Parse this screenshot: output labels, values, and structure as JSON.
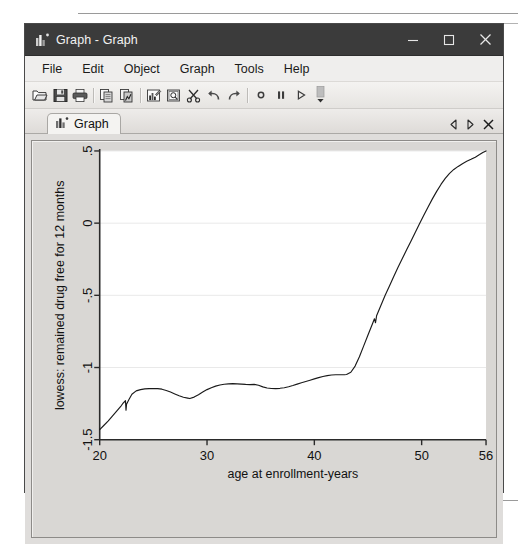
{
  "window": {
    "title": "Graph - Graph",
    "app_icon": "bar-chart-icon",
    "controls": {
      "minimize": "minimize-icon",
      "maximize": "maximize-icon",
      "close": "close-icon"
    }
  },
  "menu": {
    "items": [
      {
        "label": "File"
      },
      {
        "label": "Edit"
      },
      {
        "label": "Object"
      },
      {
        "label": "Graph"
      },
      {
        "label": "Tools"
      },
      {
        "label": "Help"
      }
    ]
  },
  "toolbar": {
    "buttons": [
      {
        "name": "open-icon"
      },
      {
        "name": "save-icon"
      },
      {
        "name": "print-icon"
      },
      {
        "name": "copy-icon"
      },
      {
        "name": "paste-graph-icon"
      },
      {
        "name": "graph-editor-icon"
      },
      {
        "name": "preview-icon"
      },
      {
        "name": "cut-icon"
      },
      {
        "name": "undo-icon"
      },
      {
        "name": "redo-icon"
      },
      {
        "name": "record-icon"
      },
      {
        "name": "pause-icon"
      },
      {
        "name": "play-icon"
      },
      {
        "name": "toolbar-overflow-icon"
      }
    ]
  },
  "tabs": {
    "items": [
      {
        "label": "Graph",
        "icon": "bar-chart-icon",
        "active": true
      }
    ],
    "nav": {
      "prev": "chevron-left-icon",
      "next": "chevron-right-icon",
      "close": "close-tab-icon"
    }
  },
  "chart_data": {
    "type": "line",
    "title": "",
    "subtitle": "",
    "xlabel": "age at enrollment-years",
    "ylabel": "lowess: remained drug free for 12 months",
    "xlim": [
      20,
      56
    ],
    "ylim": [
      -1.5,
      0.5
    ],
    "xticks": [
      20,
      30,
      40,
      50,
      56
    ],
    "xticklabels": [
      "20",
      "30",
      "40",
      "50",
      "56"
    ],
    "yticks": [
      0.5,
      0,
      -0.5,
      -1,
      -1.5
    ],
    "yticklabels": [
      ".5",
      "0",
      "-.5",
      "-1",
      "-1.5"
    ],
    "grid": "horizontal",
    "grid_color": "#e9e9e9",
    "line_color": "#1a1a1a",
    "plot_background": "#ffffff",
    "legend": "none",
    "series": [
      {
        "name": "lowess smooth",
        "points": [
          [
            20.0,
            -1.43
          ],
          [
            20.4,
            -1.4
          ],
          [
            20.8,
            -1.37
          ],
          [
            21.2,
            -1.335
          ],
          [
            21.6,
            -1.3
          ],
          [
            22.0,
            -1.265
          ],
          [
            22.2,
            -1.245
          ],
          [
            22.4,
            -1.23
          ],
          [
            22.45,
            -1.295
          ],
          [
            22.5,
            -1.255
          ],
          [
            22.7,
            -1.225
          ],
          [
            23.0,
            -1.185
          ],
          [
            23.4,
            -1.162
          ],
          [
            23.8,
            -1.153
          ],
          [
            24.2,
            -1.148
          ],
          [
            24.6,
            -1.146
          ],
          [
            25.0,
            -1.145
          ],
          [
            25.4,
            -1.146
          ],
          [
            25.8,
            -1.15
          ],
          [
            26.2,
            -1.159
          ],
          [
            26.6,
            -1.17
          ],
          [
            27.0,
            -1.183
          ],
          [
            27.4,
            -1.196
          ],
          [
            27.8,
            -1.206
          ],
          [
            28.2,
            -1.212
          ],
          [
            28.4,
            -1.215
          ],
          [
            28.8,
            -1.205
          ],
          [
            29.2,
            -1.188
          ],
          [
            29.6,
            -1.17
          ],
          [
            30.0,
            -1.153
          ],
          [
            30.4,
            -1.14
          ],
          [
            30.8,
            -1.129
          ],
          [
            31.2,
            -1.121
          ],
          [
            31.6,
            -1.116
          ],
          [
            32.0,
            -1.113
          ],
          [
            32.4,
            -1.112
          ],
          [
            32.8,
            -1.113
          ],
          [
            33.2,
            -1.115
          ],
          [
            33.6,
            -1.117
          ],
          [
            34.0,
            -1.118
          ],
          [
            34.4,
            -1.117
          ],
          [
            34.8,
            -1.123
          ],
          [
            35.2,
            -1.134
          ],
          [
            35.6,
            -1.142
          ],
          [
            36.0,
            -1.145
          ],
          [
            36.4,
            -1.146
          ],
          [
            36.8,
            -1.144
          ],
          [
            37.2,
            -1.14
          ],
          [
            37.6,
            -1.133
          ],
          [
            38.0,
            -1.125
          ],
          [
            38.4,
            -1.115
          ],
          [
            38.8,
            -1.106
          ],
          [
            39.2,
            -1.097
          ],
          [
            39.6,
            -1.088
          ],
          [
            40.0,
            -1.079
          ],
          [
            40.4,
            -1.07
          ],
          [
            40.8,
            -1.062
          ],
          [
            41.2,
            -1.056
          ],
          [
            41.6,
            -1.052
          ],
          [
            42.0,
            -1.05
          ],
          [
            42.4,
            -1.05
          ],
          [
            42.8,
            -1.05
          ],
          [
            43.0,
            -1.048
          ],
          [
            43.4,
            -1.033
          ],
          [
            43.8,
            -0.99
          ],
          [
            44.2,
            -0.925
          ],
          [
            44.6,
            -0.85
          ],
          [
            45.0,
            -0.775
          ],
          [
            45.4,
            -0.7
          ],
          [
            45.6,
            -0.662
          ],
          [
            45.7,
            -0.69
          ],
          [
            45.8,
            -0.642
          ],
          [
            46.2,
            -0.57
          ],
          [
            46.6,
            -0.5
          ],
          [
            47.0,
            -0.435
          ],
          [
            47.4,
            -0.37
          ],
          [
            47.8,
            -0.305
          ],
          [
            48.2,
            -0.245
          ],
          [
            48.6,
            -0.185
          ],
          [
            49.0,
            -0.125
          ],
          [
            49.4,
            -0.065
          ],
          [
            49.8,
            -0.005
          ],
          [
            50.2,
            0.054
          ],
          [
            50.6,
            0.112
          ],
          [
            51.0,
            0.168
          ],
          [
            51.4,
            0.22
          ],
          [
            51.8,
            0.268
          ],
          [
            52.2,
            0.31
          ],
          [
            52.6,
            0.345
          ],
          [
            53.0,
            0.372
          ],
          [
            53.4,
            0.393
          ],
          [
            53.8,
            0.412
          ],
          [
            54.2,
            0.428
          ],
          [
            54.6,
            0.442
          ],
          [
            55.0,
            0.457
          ],
          [
            55.4,
            0.475
          ],
          [
            55.7,
            0.49
          ],
          [
            56.0,
            0.5
          ]
        ]
      }
    ]
  }
}
